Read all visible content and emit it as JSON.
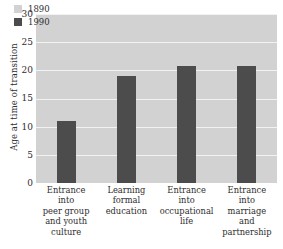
{
  "chart_data": {
    "type": "bar",
    "title": "",
    "xlabel": "",
    "ylabel": "Age at time of transition",
    "ylim": [
      0,
      30
    ],
    "yticks": [
      0,
      5,
      10,
      15,
      20,
      25,
      30
    ],
    "grid": true,
    "legend_position": "top-left",
    "categories": [
      "Entrance into peer group and youth culture",
      "Learning formal education",
      "Entrance into occupational life",
      "Entrance into marriage and partnership"
    ],
    "category_lines": [
      [
        "Entrance",
        "into",
        "peer group",
        "and youth",
        "culture"
      ],
      [
        "Learning",
        "formal",
        "education"
      ],
      [
        "Entrance",
        "into",
        "occupational",
        "life"
      ],
      [
        "Entrance",
        "into",
        "marriage",
        "and",
        "partnership"
      ]
    ],
    "series": [
      {
        "name": "1890",
        "color": "#d2d2d2",
        "values": [
          null,
          null,
          null,
          null
        ]
      },
      {
        "name": "1990",
        "color": "#4c4c4c",
        "values": [
          11.0,
          19.0,
          20.7,
          20.8
        ]
      }
    ]
  },
  "axis": {
    "y_title": "Age at time of transition",
    "y_tick_labels": [
      "30",
      "25",
      "20",
      "15",
      "10",
      "5",
      "0"
    ]
  },
  "legend": {
    "entries": [
      {
        "label": "1890"
      },
      {
        "label": "1990"
      }
    ]
  },
  "colors": {
    "plot_background": "#d2d2d2",
    "gridline": "#f2f2f2",
    "bar_1990": "#4c4c4c",
    "bar_1890": "#e8e8e8",
    "text": "#2e2e2e",
    "page_background": "#ffffff"
  }
}
